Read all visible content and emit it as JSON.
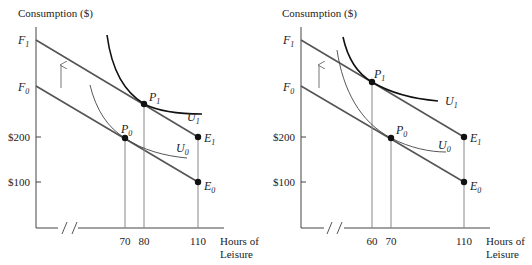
{
  "panels": [
    {
      "id": "left",
      "y_axis_title": "Consumption ($)",
      "x_axis_title_line1": "Hours of",
      "x_axis_title_line2": "Leisure",
      "y_labels": {
        "f1": "F",
        "f1_sub": "1",
        "f0": "F",
        "f0_sub": "0",
        "y200": "$200",
        "y100": "$100"
      },
      "x_ticks": [
        "70",
        "80",
        "110"
      ],
      "points": {
        "p1": {
          "label": "P",
          "sub": "1"
        },
        "p0": {
          "label": "P",
          "sub": "0"
        },
        "e1": {
          "label": "E",
          "sub": "1"
        },
        "e0": {
          "label": "E",
          "sub": "0"
        }
      },
      "curves": {
        "u1": {
          "label": "U",
          "sub": "1"
        },
        "u0": {
          "label": "U",
          "sub": "0"
        }
      }
    },
    {
      "id": "right",
      "y_axis_title": "Consumption ($)",
      "x_axis_title_line1": "Hours of",
      "x_axis_title_line2": "Leisure",
      "y_labels": {
        "f1": "F",
        "f1_sub": "1",
        "f0": "F",
        "f0_sub": "0",
        "y200": "$200",
        "y100": "$100"
      },
      "x_ticks": [
        "60",
        "70",
        "110"
      ],
      "points": {
        "p1": {
          "label": "P",
          "sub": "1"
        },
        "p0": {
          "label": "P",
          "sub": "0"
        },
        "e1": {
          "label": "E",
          "sub": "1"
        },
        "e0": {
          "label": "E",
          "sub": "0"
        }
      },
      "curves": {
        "u1": {
          "label": "U",
          "sub": "1"
        },
        "u0": {
          "label": "U",
          "sub": "0"
        }
      }
    }
  ]
}
